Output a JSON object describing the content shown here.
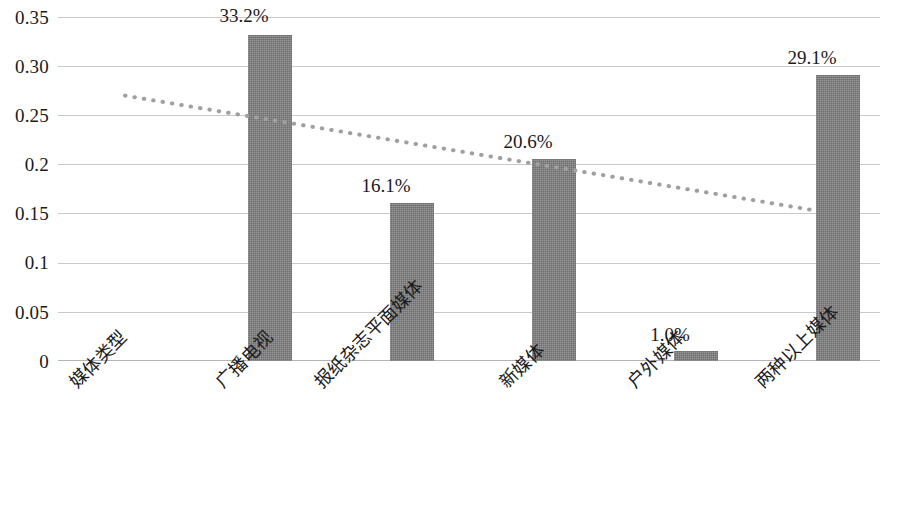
{
  "chart_data": {
    "type": "bar",
    "title": "",
    "subtitle": "",
    "xlabel": "",
    "ylabel": "",
    "categories": [
      "媒体类型",
      "广播电视",
      "报纸杂志平面媒体",
      "新媒体",
      "户外媒体",
      "两种以上媒体"
    ],
    "values": [
      null,
      0.332,
      0.161,
      0.206,
      0.01,
      0.291
    ],
    "data_labels": [
      "",
      "33.2%",
      "16.1%",
      "20.6%",
      "1.0%",
      "29.1%"
    ],
    "ylim": [
      0,
      0.35
    ],
    "y_ticks": [
      0,
      0.05,
      0.1,
      0.15,
      0.2,
      0.25,
      0.3,
      0.35
    ],
    "y_tick_labels": [
      "0",
      "0.05",
      "0.1",
      "0.15",
      "0.2",
      "0.25",
      "0.30",
      "0.35"
    ],
    "grid": true,
    "legend": false,
    "legend_position": "none",
    "series": [
      {
        "name": "比例",
        "type": "bar",
        "values": [
          null,
          0.332,
          0.161,
          0.206,
          0.01,
          0.291
        ]
      },
      {
        "name": "趋势线",
        "type": "line",
        "style": "dotted",
        "start_value": 0.27,
        "end_value": 0.154
      }
    ],
    "colors": {
      "bar_fill": "#7c7c7c",
      "gridline": "#c9c9c9",
      "axis": "#b4b4b4",
      "trendline": "#a0a0a0",
      "text": "#1a1a1a"
    }
  }
}
